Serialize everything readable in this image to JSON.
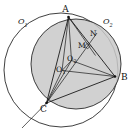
{
  "figure": {
    "background_color": "#ffffff",
    "stroke_color": "#1a1a1a",
    "shade_color": "#c9c9c9",
    "labels": {
      "A": "A",
      "B": "B",
      "C": "C",
      "M": "M",
      "N": "N",
      "center_inner": "O",
      "center_inner_sub": "2",
      "center_aux": "O",
      "center_aux_sub": "1",
      "circle_left": "O",
      "circle_left_sub": "1",
      "circle_right": "O",
      "circle_right_sub": "2"
    },
    "markers": {
      "right_angle_at": "M-N segment intersection",
      "right_angle_symbol": "square"
    },
    "points": {
      "A": {
        "x": 68.5,
        "y": 17.0
      },
      "B": {
        "x": 115.0,
        "y": 76.5
      },
      "C": {
        "x": 46.5,
        "y": 103.0
      },
      "M": {
        "x": 83.0,
        "y": 47.0
      },
      "N": {
        "x": 92.5,
        "y": 38.0
      },
      "O2": {
        "x": 71.5,
        "y": 60.5
      },
      "O1": {
        "x": 62.0,
        "y": 70.5
      }
    },
    "circles": [
      {
        "name": "outer-circle-O1",
        "cx": 61.0,
        "cy": 70.0,
        "r": 57.0,
        "filled": false
      },
      {
        "name": "inner-circle-O2",
        "cx": 76.0,
        "cy": 64.0,
        "r": 45.0,
        "filled": true
      }
    ],
    "segments": [
      "A-B",
      "B-C",
      "C-A",
      "A-O2",
      "B-O2",
      "C-O2",
      "A-O1",
      "B-O1",
      "C-O1",
      "O1-O2",
      "A-N",
      "A-M",
      "C-N",
      "C-M",
      "C-extension"
    ]
  }
}
